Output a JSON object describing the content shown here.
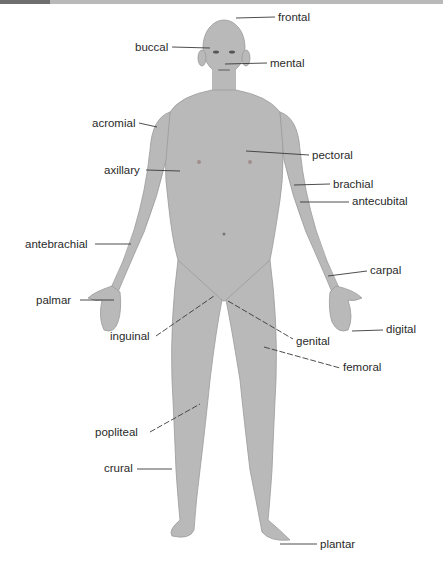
{
  "diagram": {
    "colors": {
      "skin": "#b9b9b9",
      "skin_shadow": "#9e9e9e",
      "leader": "#3a3a3a",
      "text": "#2a2a2a"
    },
    "labels": [
      {
        "id": "frontal",
        "text": "frontal",
        "x": 278,
        "y": 11
      },
      {
        "id": "buccal",
        "text": "buccal",
        "x": 135,
        "y": 42
      },
      {
        "id": "mental",
        "text": "mental",
        "x": 270,
        "y": 58
      },
      {
        "id": "acromial",
        "text": "acromial",
        "x": 92,
        "y": 118
      },
      {
        "id": "pectoral",
        "text": "pectoral",
        "x": 312,
        "y": 149
      },
      {
        "id": "axillary",
        "text": "axillary",
        "x": 104,
        "y": 164
      },
      {
        "id": "brachial",
        "text": "brachial",
        "x": 333,
        "y": 178
      },
      {
        "id": "antecubital",
        "text": "antecubital",
        "x": 352,
        "y": 195
      },
      {
        "id": "antebrachial",
        "text": "antebrachial",
        "x": 25,
        "y": 238
      },
      {
        "id": "carpal",
        "text": "carpal",
        "x": 370,
        "y": 264
      },
      {
        "id": "palmar",
        "text": "palmar",
        "x": 36,
        "y": 294
      },
      {
        "id": "digital",
        "text": "digital",
        "x": 386,
        "y": 322
      },
      {
        "id": "inguinal",
        "text": "inguinal",
        "x": 110,
        "y": 330
      },
      {
        "id": "genital",
        "text": "genital",
        "x": 296,
        "y": 335
      },
      {
        "id": "femoral",
        "text": "femoral",
        "x": 343,
        "y": 361
      },
      {
        "id": "popliteal",
        "text": "popliteal",
        "x": 95,
        "y": 427
      },
      {
        "id": "crural",
        "text": "crural",
        "x": 104,
        "y": 462
      },
      {
        "id": "plantar",
        "text": "plantar",
        "x": 320,
        "y": 538
      }
    ]
  }
}
